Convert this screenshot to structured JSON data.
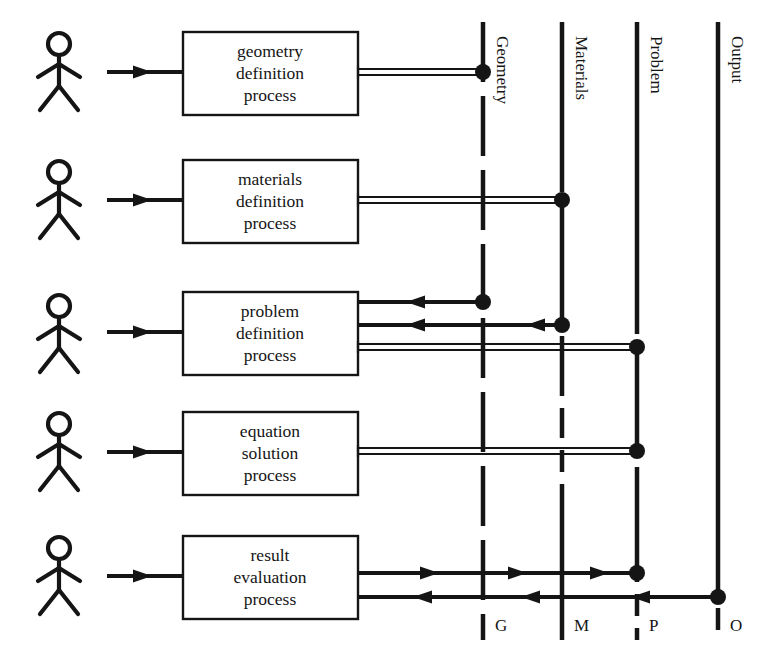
{
  "diagram": {
    "stroke_color": "#151515",
    "background_color": "#ffffff",
    "box_fill": "#ffffff"
  },
  "actors": [
    {
      "id": "actor-geometry",
      "name": "stick-figure-actor"
    },
    {
      "id": "actor-materials",
      "name": "stick-figure-actor"
    },
    {
      "id": "actor-problem",
      "name": "stick-figure-actor"
    },
    {
      "id": "actor-equation",
      "name": "stick-figure-actor"
    },
    {
      "id": "actor-result",
      "name": "stick-figure-actor"
    }
  ],
  "processes": [
    {
      "id": "geometry-definition-process",
      "line1": "geometry",
      "line2": "definition",
      "line3": "process"
    },
    {
      "id": "materials-definition-process",
      "line1": "materials",
      "line2": "definition",
      "line3": "process"
    },
    {
      "id": "problem-definition-process",
      "line1": "problem",
      "line2": "definition",
      "line3": "process"
    },
    {
      "id": "equation-solution-process",
      "line1": "equation",
      "line2": "solution",
      "line3": "process"
    },
    {
      "id": "result-evaluation-process",
      "line1": "result",
      "line2": "evaluation",
      "line3": "process"
    }
  ],
  "lifelines": [
    {
      "id": "lifeline-geometry",
      "label": "Geometry",
      "key": "G",
      "style": "dashed"
    },
    {
      "id": "lifeline-materials",
      "label": "Materials",
      "key": "M",
      "style": "dashed"
    },
    {
      "id": "lifeline-problem",
      "label": "Problem",
      "key": "P",
      "style": "dashed"
    },
    {
      "id": "lifeline-output",
      "label": "Output",
      "key": "O",
      "style": "dashed"
    }
  ],
  "connections": [
    {
      "id": "actor-to-geometry-process",
      "kind": "arrow",
      "direction": "right"
    },
    {
      "id": "actor-to-materials-process",
      "kind": "arrow",
      "direction": "right"
    },
    {
      "id": "actor-to-problem-process",
      "kind": "arrow",
      "direction": "right"
    },
    {
      "id": "actor-to-equation-process",
      "kind": "arrow",
      "direction": "right"
    },
    {
      "id": "actor-to-result-process",
      "kind": "arrow",
      "direction": "right"
    },
    {
      "id": "geometry-process-writes-geometry",
      "kind": "double-line",
      "from": "geometry-definition-process",
      "to": "lifeline-geometry"
    },
    {
      "id": "materials-process-writes-materials",
      "kind": "double-line",
      "from": "materials-definition-process",
      "to": "lifeline-materials"
    },
    {
      "id": "geometry-reads-into-problem-process",
      "kind": "arrow",
      "direction": "left",
      "from": "lifeline-geometry",
      "to": "problem-definition-process"
    },
    {
      "id": "materials-reads-into-problem-process",
      "kind": "arrow",
      "direction": "left",
      "from": "lifeline-materials",
      "to": "problem-definition-process"
    },
    {
      "id": "problem-process-writes-problem",
      "kind": "double-line",
      "from": "problem-definition-process",
      "to": "lifeline-problem"
    },
    {
      "id": "equation-process-writes-problem",
      "kind": "double-line",
      "from": "equation-solution-process",
      "to": "lifeline-problem"
    },
    {
      "id": "result-process-writes-problem",
      "kind": "arrow",
      "direction": "right",
      "from": "result-evaluation-process",
      "to": "lifeline-problem"
    },
    {
      "id": "output-reads-into-result-process",
      "kind": "arrow",
      "direction": "left",
      "from": "lifeline-output",
      "to": "result-evaluation-process"
    }
  ]
}
